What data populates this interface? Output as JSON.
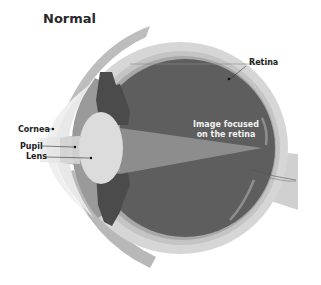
{
  "title": "Normal",
  "labels": {
    "retina": "Retina",
    "cornea": "Cornea",
    "pupil": "Pupil",
    "lens": "Lens",
    "focus_line1": "Image focused",
    "focus_line2": "on the retina"
  },
  "colors": {
    "sclera_outer": "#d4d4d4",
    "sclera_inner": "#c2c2c2",
    "choroid": "#a9a9a9",
    "vitreous": "#5c5c5c",
    "iris": "#4a4a4a",
    "lens": "#d9d9d9",
    "cornea": "#e6e6e6",
    "beam": "#9c9c9c",
    "optic_nerve": "#d0d0d0",
    "eyelid": "#b5b5b5"
  }
}
